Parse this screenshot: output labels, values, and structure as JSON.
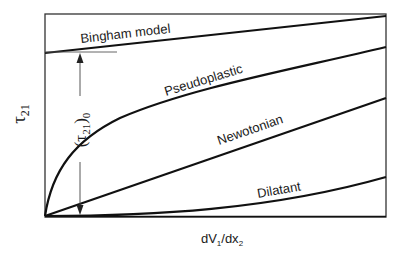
{
  "diagram": {
    "type": "rheology-flow-curves",
    "y_axis_label": {
      "symbol": "τ",
      "subscript": "21"
    },
    "x_axis_label": {
      "part1": "dV",
      "sub1": "1",
      "part2": "/dx",
      "sub2": "2"
    },
    "yield_stress_label": {
      "open": "(",
      "symbol": "τ",
      "subscript": "21",
      "close": ")",
      "outer_subscript": "0"
    },
    "curves": [
      {
        "name": "bingham",
        "label": "Bingham model",
        "shape": "straight line with positive intercept"
      },
      {
        "name": "pseudoplastic",
        "label": "Pseudoplastic",
        "shape": "concave down, through origin"
      },
      {
        "name": "newtonian",
        "label": "Newotonian",
        "shape": "straight line through origin"
      },
      {
        "name": "dilatant",
        "label": "Dilatant",
        "shape": "concave up, through origin"
      }
    ],
    "colors": {
      "line": "#111111",
      "arrow": "#444444",
      "frame": "#333333",
      "background": "#ffffff"
    }
  }
}
